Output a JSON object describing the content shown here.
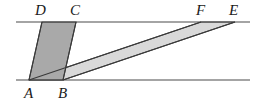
{
  "figure": {
    "canvas": {
      "width": 265,
      "height": 108
    },
    "colors": {
      "background": "#ffffff",
      "stroke": "#3a3a3a",
      "parallel_line": "#4a4a4a",
      "dark_fill": "#a9a9a9",
      "light_fill": "#d9d9d9",
      "label": "#1a1a1a"
    },
    "parallel_lines": [
      {
        "name": "top-line",
        "y": 22,
        "x1": 16,
        "x2": 250
      },
      {
        "name": "bottom-line",
        "y": 80,
        "x1": 16,
        "x2": 250
      }
    ],
    "points": [
      {
        "id": "A",
        "label": "A",
        "x": 29,
        "y": 80
      },
      {
        "id": "B",
        "label": "B",
        "x": 63,
        "y": 80
      },
      {
        "id": "C",
        "label": "C",
        "x": 76,
        "y": 22
      },
      {
        "id": "D",
        "label": "D",
        "x": 42,
        "y": 22
      },
      {
        "id": "E",
        "label": "E",
        "x": 235,
        "y": 22
      },
      {
        "id": "F",
        "label": "F",
        "x": 201,
        "y": 22
      }
    ],
    "shapes": [
      {
        "name": "parallelogram-ABCD",
        "fill": "#a9a9a9",
        "stroke": "#3a3a3a",
        "vertex_ids": [
          "A",
          "B",
          "C",
          "D"
        ],
        "polygon": "29,80 63,80 76,22 42,22"
      },
      {
        "name": "parallelogram-ABEF",
        "fill": "#d9d9d9",
        "stroke": "#3a3a3a",
        "vertex_ids": [
          "A",
          "B",
          "E",
          "F"
        ],
        "polygon": "29,80 63,80 235,22 201,22"
      }
    ],
    "labels": [
      {
        "id": "label-A",
        "text": "A",
        "x": 24,
        "y": 86
      },
      {
        "id": "label-B",
        "text": "B",
        "x": 58,
        "y": 86
      },
      {
        "id": "label-C",
        "text": "C",
        "x": 70,
        "y": 3
      },
      {
        "id": "label-D",
        "text": "D",
        "x": 35,
        "y": 3
      },
      {
        "id": "label-E",
        "text": "E",
        "x": 229,
        "y": 3
      },
      {
        "id": "label-F",
        "text": "F",
        "x": 196,
        "y": 3
      }
    ]
  }
}
